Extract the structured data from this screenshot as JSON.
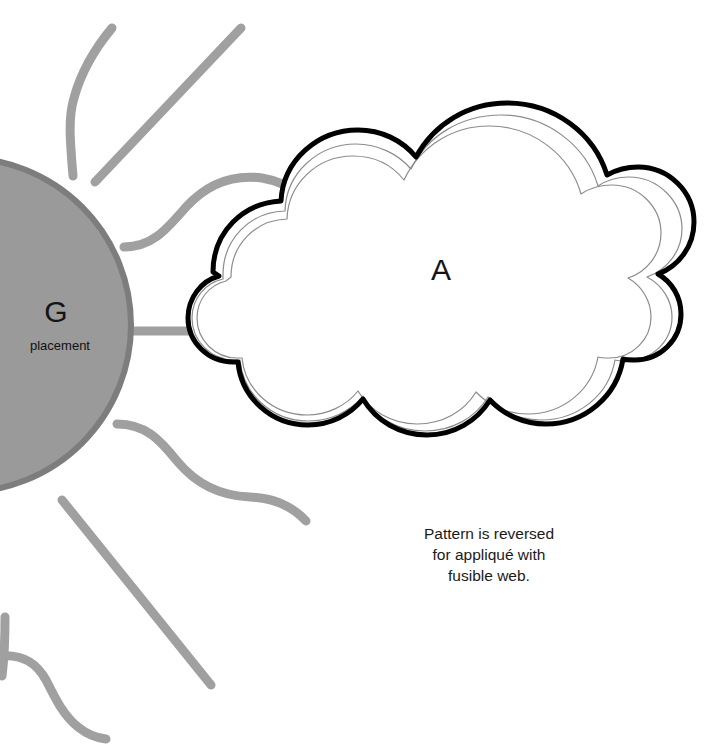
{
  "sheet": {
    "background_color": "#ffffff",
    "width": 704,
    "height": 750
  },
  "sun_piece": {
    "label": "G",
    "sublabel": "placement",
    "fill_color": "#9a9a9a",
    "edge_color": "#7d7d7d",
    "ray_color": "#a0a0a0",
    "ray_count": 8
  },
  "cloud_piece": {
    "label": "A",
    "outline_color": "#000000",
    "inner_line_color": "#8c8c8c",
    "fill_color": "#ffffff"
  },
  "note": {
    "line1": "Pattern is reversed",
    "line2": "for appliqué with",
    "line3": "fusible web."
  }
}
